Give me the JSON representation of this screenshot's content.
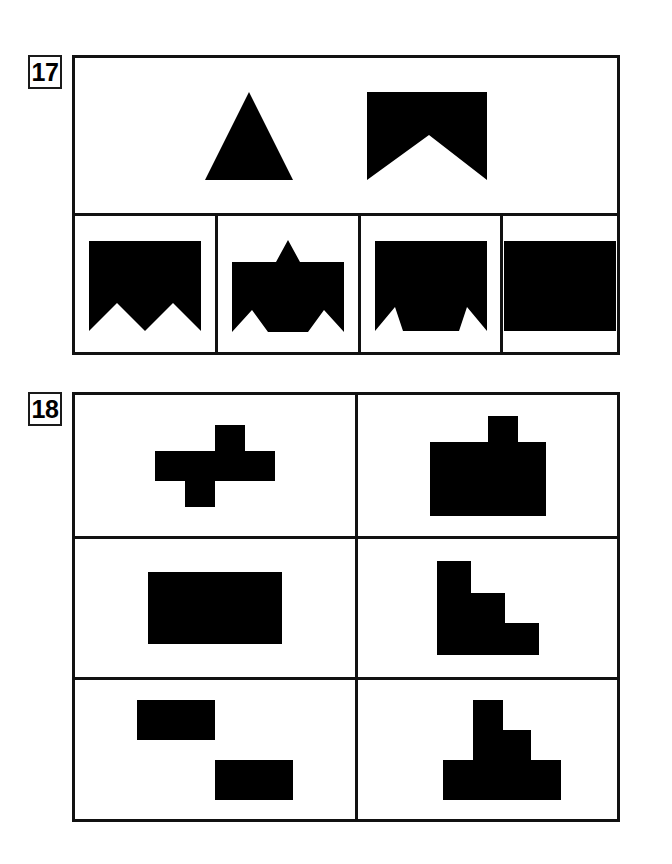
{
  "page": {
    "width": 672,
    "height": 864,
    "background": "#ffffff",
    "ink": "#000000",
    "line_color": "#111111",
    "type": "visual-reasoning-worksheet"
  },
  "puzzles": [
    {
      "number": "17",
      "label_text": "17",
      "kind": "shape-assembly-multiple-choice",
      "prompt": {
        "name": "prompt-row",
        "pieces": [
          {
            "name": "triangle-piece",
            "description": "solid black equilateral triangle pointing up",
            "polygon_points": "44,0 88,88 0,88",
            "width": 88,
            "height": 88
          },
          {
            "name": "notched-rectangle-piece",
            "description": "solid black rectangle with large triangular V notch cut out of the bottom edge",
            "polygon_points": "0,0 120,0 120,88 62,43 0,88",
            "width": 120,
            "height": 88
          }
        ]
      },
      "options": [
        {
          "name": "option-a",
          "letter": "A",
          "description": "black rectangle with two white wedge notches cut from bottom edge meeting at a central downward point",
          "polygon_points": "0,0 112,0 112,90 84,62 56,90 28,62 0,90",
          "width": 112,
          "height": 90
        },
        {
          "name": "option-b",
          "letter": "B",
          "description": "black rectangle with a triangular spike on top and two wedge notches cut from bottom corners",
          "polygon_points": "0,22 44,22 56,0 68,22 112,22 112,92 92,70 76,92 36,92 20,70 0,92",
          "width": 112,
          "height": 92
        },
        {
          "name": "option-c",
          "letter": "C",
          "description": "black rectangle with two small white wedge notches cut from the bottom corners",
          "polygon_points": "0,0 112,0 112,90 92,66 84,90 28,90 20,66 0,90",
          "width": 112,
          "height": 90
        },
        {
          "name": "option-d",
          "letter": "D",
          "description": "plain solid black rectangle, no notches",
          "polygon_points": "0,0 112,0 112,90 0,90",
          "width": 112,
          "height": 90
        }
      ]
    },
    {
      "number": "18",
      "label_text": "18",
      "kind": "polyomino-grid",
      "grid": {
        "rows": 3,
        "columns": 2
      },
      "cells": [
        {
          "name": "cell-r1c1",
          "row": 1,
          "column": 1,
          "description": "long horizontal bar with one square tab up on the right and one square tab down on the left",
          "polygon_points": "0,26 60,26 60,0 90,0 90,26 120,26 120,56 60,56 60,82 30,82 30,56 0,56",
          "width": 186,
          "height": 82
        },
        {
          "name": "cell-r1c2",
          "row": 1,
          "column": 2,
          "description": "wide rectangle with a single square tab on top, slightly right of center",
          "polygon_points": "0,26 58,26 58,0 88,0 88,26 116,26 116,100 0,100",
          "width": 116,
          "height": 100
        },
        {
          "name": "cell-r2c1",
          "row": 2,
          "column": 1,
          "description": "plain solid rectangle",
          "polygon_points": "0,0 134,0 134,72 0,72",
          "width": 134,
          "height": 72
        },
        {
          "name": "cell-r2c2",
          "row": 2,
          "column": 2,
          "description": "descending staircase of three steps opening to the upper right",
          "polygon_points": "0,0 34,0 34,32 68,32 68,62 102,62 102,94 0,94",
          "width": 102,
          "height": 94
        },
        {
          "name": "cell-r3c1",
          "row": 3,
          "column": 1,
          "description": "zigzag staircase descending to the right with three treads",
          "polygon_points": "0,0 78,0 78,60 156,60 156,100 78,100 78,40 0,40",
          "width": 190,
          "height": 100
        },
        {
          "name": "cell-r3c2",
          "row": 3,
          "column": 2,
          "description": "stepped pyramid: narrow top block on a wider middle block on a widest bottom block",
          "polygon_points": "58,0 88,0 88,30 116,30 116,60 146,60 146,100 28,100 28,60 58,60",
          "width": 146,
          "height": 100
        }
      ]
    }
  ]
}
